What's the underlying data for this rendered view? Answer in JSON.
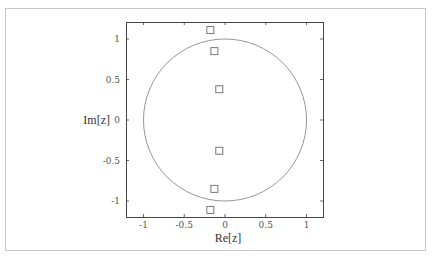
{
  "chart_data": {
    "type": "scatter",
    "title": "",
    "xlabel": "Re[z]",
    "ylabel": "Im[z]",
    "xlim": [
      -1.2,
      1.2
    ],
    "ylim": [
      -1.2,
      1.2
    ],
    "xticks": [
      -1,
      -0.5,
      0,
      0.5,
      1
    ],
    "yticks": [
      -1,
      -0.5,
      0,
      0.5,
      1
    ],
    "xtick_labels": [
      "-1",
      "-0.5",
      "0",
      "0.5",
      "1"
    ],
    "ytick_labels": [
      "-1",
      "-0.5",
      "0",
      "0.5",
      "1"
    ],
    "grid": false,
    "legend": null,
    "series": [
      {
        "name": "points",
        "marker": "square-open",
        "x": [
          -0.18,
          -0.13,
          -0.07,
          -0.07,
          -0.13,
          -0.18
        ],
        "y": [
          1.11,
          0.85,
          0.38,
          -0.38,
          -0.85,
          -1.11
        ]
      }
    ],
    "annotations": [
      {
        "type": "circle",
        "center": [
          0,
          0
        ],
        "radius": 1,
        "label": "unit circle"
      }
    ],
    "colors": {
      "axis": "#444444",
      "circle": "#8a8a8a",
      "marker": "#6a6a6a"
    }
  }
}
